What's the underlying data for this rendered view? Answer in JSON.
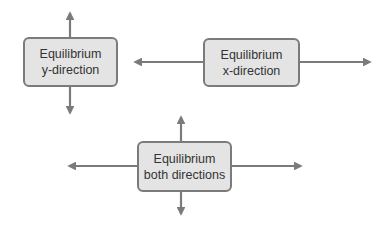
{
  "diagram": {
    "colors": {
      "box_fill": "#e4e4e4",
      "box_border": "#7b7b7b",
      "arrow": "#7b7b7b",
      "text": "#333333",
      "background": "#ffffff"
    },
    "nodes": [
      {
        "id": "y-direction",
        "line1": "Equilibrium",
        "line2": "y-direction",
        "arrows": [
          "up",
          "down"
        ]
      },
      {
        "id": "x-direction",
        "line1": "Equilibrium",
        "line2": "x-direction",
        "arrows": [
          "left",
          "right"
        ]
      },
      {
        "id": "both-directions",
        "line1": "Equilibrium",
        "line2": "both directions",
        "arrows": [
          "up",
          "down",
          "left",
          "right"
        ]
      }
    ]
  }
}
